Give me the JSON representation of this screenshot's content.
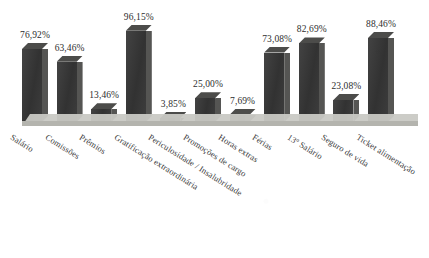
{
  "chart_data": {
    "type": "bar",
    "title": "",
    "subtitle": "",
    "xlabel": "",
    "ylabel": "",
    "ylim": [
      0,
      100
    ],
    "grid": false,
    "legend": "none",
    "value_suffix": "%",
    "decimal_separator": ",",
    "categories": [
      "Salário",
      "Comissões",
      "Prêmios",
      "Gratificação extraordinária",
      "Periculosidade / Insalubridade",
      "Promoções de cargo",
      "Horas extras",
      "Férias",
      "13º Salário",
      "Seguro de vida",
      "Ticket alimentação"
    ],
    "values": [
      76.92,
      63.46,
      13.46,
      96.15,
      3.85,
      25.0,
      7.69,
      73.08,
      82.69,
      23.08,
      88.46
    ],
    "labels": [
      "76,92%",
      "63,46%",
      "13,46%",
      "96,15%",
      "3,85%",
      "25,00%",
      "7,69%",
      "73,08%",
      "82,69%",
      "23,08%",
      "88,46%"
    ]
  },
  "style": {
    "bar_color": "#3a3a3a",
    "bar_side_color": "#555553",
    "bar_top_color": "#4c4c4a",
    "floor_color": "#c9c9c4",
    "background": "#ffffff",
    "text_color": "#2e2e2e"
  }
}
